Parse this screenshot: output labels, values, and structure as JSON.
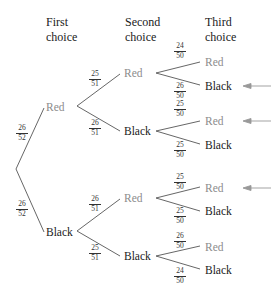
{
  "headers": {
    "first": [
      "First",
      "choice"
    ],
    "second": [
      "Second",
      "choice"
    ],
    "third": [
      "Third",
      "choice"
    ]
  },
  "colors": {
    "red_label": "#8c8c8c",
    "black_label": "#1a1a1a",
    "line": "#555555",
    "arrow": "#999999"
  },
  "level1": [
    {
      "label": "Red",
      "color": "red",
      "prob_num": "26",
      "prob_den": "52"
    },
    {
      "label": "Black",
      "color": "black",
      "prob_num": "26",
      "prob_den": "52"
    }
  ],
  "level2": [
    {
      "label": "Red",
      "color": "red",
      "prob_num": "25",
      "prob_den": "51"
    },
    {
      "label": "Black",
      "color": "black",
      "prob_num": "26",
      "prob_den": "51"
    },
    {
      "label": "Red",
      "color": "red",
      "prob_num": "26",
      "prob_den": "51"
    },
    {
      "label": "Black",
      "color": "black",
      "prob_num": "25",
      "prob_den": "51"
    }
  ],
  "level3": [
    {
      "label": "Red",
      "color": "red",
      "prob_num": "24",
      "prob_den": "50",
      "arrow": false
    },
    {
      "label": "Black",
      "color": "black",
      "prob_num": "26",
      "prob_den": "50",
      "arrow": true
    },
    {
      "label": "Red",
      "color": "red",
      "prob_num": "25",
      "prob_den": "50",
      "arrow": true
    },
    {
      "label": "Black",
      "color": "black",
      "prob_num": "25",
      "prob_den": "50",
      "arrow": false
    },
    {
      "label": "Red",
      "color": "red",
      "prob_num": "25",
      "prob_den": "50",
      "arrow": true
    },
    {
      "label": "Black",
      "color": "black",
      "prob_num": "25",
      "prob_den": "50",
      "arrow": false
    },
    {
      "label": "Red",
      "color": "red",
      "prob_num": "26",
      "prob_den": "50",
      "arrow": false
    },
    {
      "label": "Black",
      "color": "black",
      "prob_num": "24",
      "prob_den": "50",
      "arrow": false
    }
  ]
}
